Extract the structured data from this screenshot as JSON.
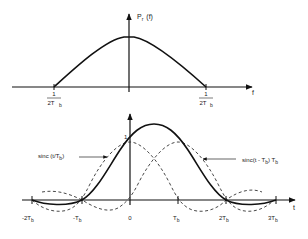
{
  "top_plot": {
    "y_label": "P",
    "y_label_sub": "r",
    "y_label_arg": "(f)",
    "x_label": "f",
    "left_tick": {
      "num": "1",
      "den": "2T",
      "den_sub": "b",
      "sign": "-"
    },
    "right_tick": {
      "num": "1",
      "den": "2T",
      "den_sub": "b"
    }
  },
  "bottom_plot": {
    "x_label": "t",
    "unit_mark": "1",
    "ticks": [
      {
        "main": "-2T",
        "sub": "b"
      },
      {
        "main": "-T",
        "sub": "b"
      },
      {
        "main": "0",
        "sub": ""
      },
      {
        "main": "T",
        "sub": "b"
      },
      {
        "main": "2T",
        "sub": "b"
      },
      {
        "main": "3T",
        "sub": "b"
      }
    ],
    "annotation_left": {
      "text": "sinc (t/T",
      "sub": "b",
      "close": ")"
    },
    "annotation_right": {
      "text": "sinc(t - T",
      "sub1": "b",
      "mid": ") T",
      "sub2": "b"
    }
  },
  "colors": {
    "line": "#111111",
    "dash": "#333333",
    "text": "#222222"
  }
}
